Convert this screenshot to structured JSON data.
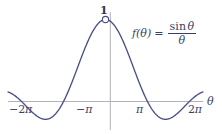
{
  "figure": {
    "background_color": "#ffffff"
  },
  "formula": {
    "lhs": "f(θ)",
    "equals": "=",
    "numerator_fn": "sin",
    "numerator_var": "θ",
    "denominator": "θ"
  },
  "annotations": {
    "peak_value_label": "1",
    "axis_label_x": "θ"
  },
  "axes": {
    "x_tick_labels": [
      {
        "minus": "−",
        "num": "2",
        "sym": "π"
      },
      {
        "minus": "−",
        "num": "",
        "sym": "π"
      },
      {
        "minus": "",
        "num": "",
        "sym": "π"
      },
      {
        "minus": "",
        "num": "2",
        "sym": "π"
      }
    ],
    "axis_color": "#b2b2bd",
    "curve_color": "#4a5089"
  },
  "chart_data": {
    "type": "line",
    "title": "",
    "subtitle": "",
    "xlabel": "θ",
    "ylabel": "",
    "grid": false,
    "legend": null,
    "xlim": [
      -7.3,
      7.3
    ],
    "ylim": [
      -0.29,
      1.12
    ],
    "xticks": [
      -6.283185,
      -3.141593,
      3.141593,
      6.283185
    ],
    "xticklabels": [
      "−2π",
      "−π",
      "π",
      "2π"
    ],
    "yticks": [
      1
    ],
    "yticklabels": [
      "1"
    ],
    "annotations": [
      {
        "text": "1",
        "x": 0,
        "y": 1,
        "marker": "open-circle",
        "note": "removable discontinuity at theta = 0, limit value 1"
      },
      {
        "text": "f(θ) = sin θ / θ",
        "x": 3.0,
        "y": 0.82,
        "marker": "none",
        "note": "function label"
      }
    ],
    "series": [
      {
        "name": "sin(θ)/θ",
        "color": "#4a5089",
        "x": [
          -7.3,
          -7.0,
          -6.6,
          -6.283185,
          -6.0,
          -5.6,
          -5.2,
          -4.712389,
          -4.3,
          -3.9,
          -3.141593,
          -2.8,
          -2.4,
          -2.0,
          -1.570796,
          -1.2,
          -0.8,
          -0.4,
          0.0,
          0.4,
          0.8,
          1.2,
          1.570796,
          2.0,
          2.4,
          2.8,
          3.141593,
          3.9,
          4.3,
          4.712389,
          5.2,
          5.6,
          6.0,
          6.283185,
          6.6,
          7.0,
          7.3
        ],
        "y": [
          0.1218,
          0.0939,
          0.0475,
          0.0,
          -0.0465,
          -0.1126,
          -0.1692,
          -0.2122,
          -0.2151,
          -0.1798,
          0.0,
          0.1204,
          0.2809,
          0.4546,
          0.6366,
          0.7767,
          0.8967,
          0.9735,
          1.0,
          0.9735,
          0.8967,
          0.7767,
          0.6366,
          0.4546,
          0.2809,
          0.1204,
          0.0,
          -0.1798,
          -0.2151,
          -0.2122,
          -0.1692,
          -0.1126,
          -0.0465,
          0.0,
          0.0475,
          0.0939,
          0.1218
        ]
      }
    ]
  }
}
